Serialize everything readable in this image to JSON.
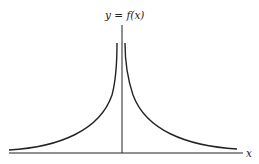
{
  "figure": {
    "y_label": "y = f(x)",
    "x_label": "x",
    "curve": "symmetric function rising toward a vertical asymptote at x = 0 and decaying toward the x-axis as |x| grows",
    "colors": {
      "line": "#222222",
      "background": "#ffffff"
    }
  }
}
